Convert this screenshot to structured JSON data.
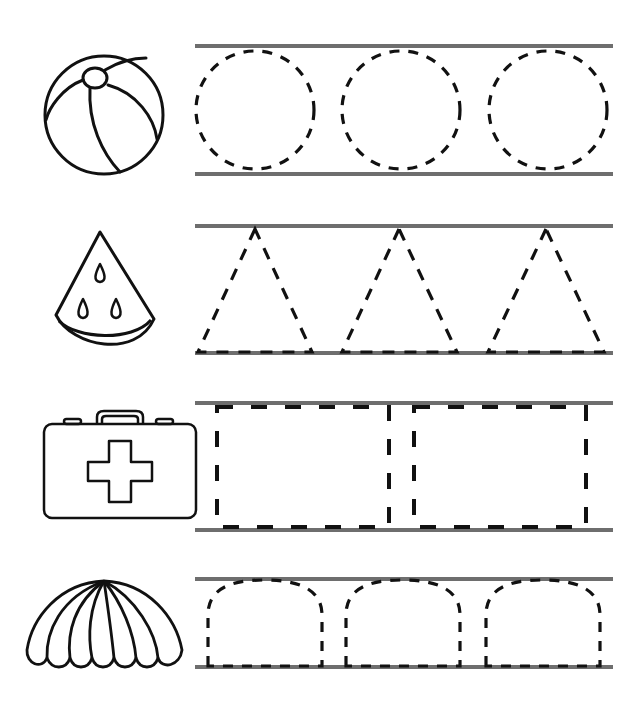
{
  "worksheet": {
    "title": "Shape tracing worksheet",
    "line_color": "#6e6e6e",
    "stroke_color": "#111111",
    "rows": [
      {
        "icon": "beach-ball-icon",
        "shape": "circle",
        "count": 3
      },
      {
        "icon": "watermelon-slice-icon",
        "shape": "triangle",
        "count": 3
      },
      {
        "icon": "first-aid-kit-icon",
        "shape": "rectangle",
        "count": 2
      },
      {
        "icon": "shell-icon",
        "shape": "arch",
        "count": 3
      }
    ]
  }
}
